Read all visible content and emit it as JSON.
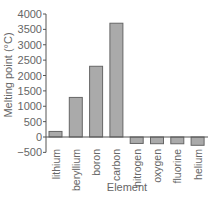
{
  "chart_data": {
    "type": "bar",
    "title": "",
    "xlabel": "Element",
    "ylabel": "Melting point (°C)",
    "categories": [
      "lithium",
      "beryllium",
      "boron",
      "carbon",
      "nitrogen",
      "oxygen",
      "fluorine",
      "helium"
    ],
    "values": [
      181,
      1287,
      2300,
      3700,
      -210,
      -218,
      -220,
      -270
    ],
    "ylim": [
      -500,
      4000
    ],
    "yticks": [
      -500,
      0,
      500,
      1000,
      1500,
      2000,
      2500,
      3000,
      3500,
      4000
    ],
    "ytick_labels": [
      "−500",
      "0",
      "500",
      "1000",
      "1500",
      "2000",
      "2500",
      "3000",
      "3500",
      "4000"
    ],
    "grid": false,
    "legend": null,
    "colors": {
      "bar_fill": "#aaaaaa",
      "bar_stroke": "#666666",
      "axis": "#555555"
    }
  }
}
